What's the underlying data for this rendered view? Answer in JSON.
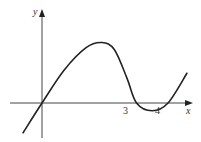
{
  "chart_data": {
    "type": "line",
    "title": "",
    "xlabel": "x",
    "ylabel": "y",
    "x_tick_labels": [
      "3",
      "4"
    ],
    "roots": [
      0,
      3,
      4
    ],
    "curve_points": [
      {
        "x": -0.6,
        "y": -1.45
      },
      {
        "x": 0,
        "y": 0
      },
      {
        "x": 0.7,
        "y": 1.6
      },
      {
        "x": 1.4,
        "y": 2.7
      },
      {
        "x": 1.9,
        "y": 2.95
      },
      {
        "x": 2.3,
        "y": 2.6
      },
      {
        "x": 2.7,
        "y": 1.2
      },
      {
        "x": 3,
        "y": 0
      },
      {
        "x": 3.5,
        "y": -0.38
      },
      {
        "x": 4,
        "y": 0
      },
      {
        "x": 4.6,
        "y": 1.45
      }
    ],
    "xlim": [
      -1.3,
      5.3
    ],
    "ylim": [
      -1.7,
      3.6
    ],
    "grid": false,
    "legend": "none"
  },
  "labels": {
    "x_axis": "x",
    "y_axis": "y",
    "tick_3": "3",
    "tick_4": "4"
  }
}
